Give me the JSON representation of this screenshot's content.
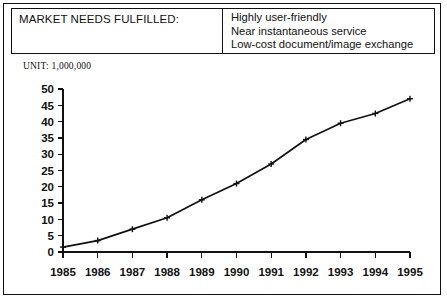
{
  "header": {
    "title": "MARKET NEEDS FULFILLED:",
    "needs": [
      "Highly user-friendly",
      "Near instantaneous service",
      "Low-cost document/image exchange"
    ]
  },
  "unit_label": "UNIT: 1,000,000",
  "colors": {
    "ink": "#111111",
    "paper": "#ffffff"
  },
  "chart_data": {
    "type": "line",
    "title": "",
    "xlabel": "",
    "ylabel": "",
    "unit": "UNIT: 1,000,000",
    "categories": [
      "1985",
      "1986",
      "1987",
      "1988",
      "1989",
      "1990",
      "1991",
      "1992",
      "1993",
      "1994",
      "1995"
    ],
    "values": [
      1.5,
      3.5,
      7,
      10.5,
      16,
      21,
      27,
      34.5,
      39.5,
      42.5,
      47
    ],
    "series": [
      {
        "name": "Market needs fulfilled",
        "values": [
          1.5,
          3.5,
          7,
          10.5,
          16,
          21,
          27,
          34.5,
          39.5,
          42.5,
          47
        ]
      }
    ],
    "ylim": [
      0,
      50
    ],
    "yticks": [
      0,
      5,
      10,
      15,
      20,
      25,
      30,
      35,
      40,
      45,
      50
    ],
    "ytick_labels": [
      "0",
      "5",
      "10",
      "15",
      "20",
      "25",
      "30",
      "35",
      "40",
      "45",
      "50"
    ],
    "xtick_labels": [
      "1985",
      "1986",
      "1987",
      "1988",
      "1989",
      "1990",
      "1991",
      "1992",
      "1993",
      "1994",
      "1995"
    ],
    "grid": false,
    "legend": false,
    "marker": "plus",
    "line_color": "#111111"
  }
}
